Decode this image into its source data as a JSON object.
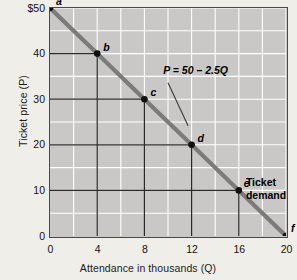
{
  "chart_data": {
    "type": "line",
    "title": "",
    "xlabel": "Attendance in thousands (Q)",
    "ylabel": "Ticket price (P)",
    "xlim": [
      0,
      20
    ],
    "ylim": [
      0,
      50
    ],
    "xticks": [
      "0",
      "4",
      "8",
      "12",
      "16",
      "20"
    ],
    "xtick_values": [
      0,
      4,
      8,
      12,
      16,
      20
    ],
    "yticks": [
      "0",
      "10",
      "20",
      "30",
      "40",
      "$50"
    ],
    "ytick_values": [
      0,
      10,
      20,
      30,
      40,
      50
    ],
    "grid": true,
    "grid_color": "#ffffff",
    "plot_background": "#c9c8c6",
    "line_color": "#7b7b7b",
    "point_color": "#101010",
    "equation": "P = 50 – 2.5Q",
    "series": [
      {
        "name": "Ticket demand",
        "x": [
          0,
          4,
          8,
          12,
          16,
          20
        ],
        "values": [
          50,
          40,
          30,
          20,
          10,
          0
        ]
      }
    ],
    "points": [
      {
        "label": "a",
        "q": 0,
        "p": 50,
        "label_dx": 6,
        "label_dy": -13,
        "connectors": false
      },
      {
        "label": "b",
        "q": 4,
        "p": 40,
        "label_dx": 6,
        "label_dy": -13,
        "connectors": true
      },
      {
        "label": "c",
        "q": 8,
        "p": 30,
        "label_dx": 6,
        "label_dy": -13,
        "connectors": true
      },
      {
        "label": "d",
        "q": 12,
        "p": 20,
        "label_dx": 6,
        "label_dy": -13,
        "connectors": true
      },
      {
        "label": "e",
        "q": 16,
        "p": 10,
        "label_dx": 5,
        "label_dy": -13,
        "connectors": true
      },
      {
        "label": "f",
        "q": 20,
        "p": 0,
        "label_dx": 5,
        "label_dy": -14,
        "connectors": false
      }
    ],
    "annotations": [
      {
        "name": "equation-label",
        "text": "P = 50 – 2.5Q",
        "q": 9.6,
        "p": 36.2,
        "leader_from": {
          "q": 10.0,
          "p": 33.6
        },
        "leader_to": {
          "q": 11.7,
          "p": 24.2
        }
      },
      {
        "name": "demand-label",
        "line1": "Ticket",
        "line2": "demand",
        "q": 16.6,
        "p": 11.6
      }
    ]
  },
  "page": {
    "background": "#efeee9"
  }
}
